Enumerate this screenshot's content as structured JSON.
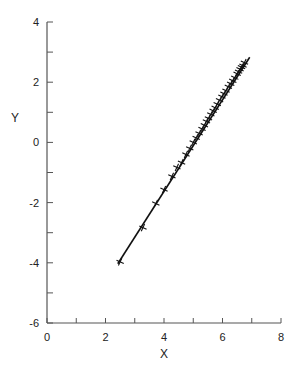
{
  "chart_data": {
    "type": "scatter",
    "title": "",
    "xlabel": "X",
    "ylabel": "Y",
    "xlim": [
      0,
      8
    ],
    "ylim": [
      -6,
      4
    ],
    "x_ticks": [
      0,
      2,
      4,
      6,
      8
    ],
    "x_minor_ticks": [
      1,
      3,
      5,
      7
    ],
    "y_ticks": [
      -6,
      -4,
      -2,
      0,
      2,
      4
    ],
    "y_minor_ticks": [
      -5,
      -3,
      -1,
      1,
      3
    ],
    "grid": false,
    "legend": null,
    "marker": "plus",
    "series": [
      {
        "name": "observations",
        "x": [
          2.5,
          3.28,
          3.72,
          4.0,
          4.27,
          4.44,
          4.6,
          4.75,
          4.88,
          5.0,
          5.1,
          5.2,
          5.3,
          5.38,
          5.45,
          5.52,
          5.6,
          5.68,
          5.75,
          5.82,
          5.9,
          5.98,
          6.05,
          6.12,
          6.2,
          6.28,
          6.35,
          6.42,
          6.5,
          6.55,
          6.6,
          6.65,
          6.7,
          6.75
        ],
        "y": [
          -3.97,
          -2.83,
          -2.03,
          -1.57,
          -1.13,
          -0.83,
          -0.67,
          -0.4,
          -0.2,
          0.0,
          0.15,
          0.3,
          0.45,
          0.57,
          0.7,
          0.8,
          0.93,
          1.05,
          1.15,
          1.27,
          1.4,
          1.52,
          1.62,
          1.72,
          1.85,
          1.95,
          2.05,
          2.15,
          2.28,
          2.35,
          2.43,
          2.5,
          2.55,
          2.65
        ]
      }
    ],
    "fit_line": {
      "name": "regression",
      "x": [
        2.42,
        6.93
      ],
      "y": [
        -4.03,
        2.83
      ]
    }
  }
}
